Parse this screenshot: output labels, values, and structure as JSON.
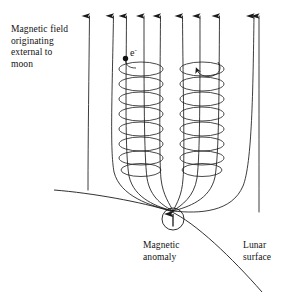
{
  "figure": {
    "background_color": "#ffffff",
    "line_color": "#1a1a1a",
    "text_color": "#111111"
  },
  "labels": {
    "external_field": "Magnetic field\noriginating\nexternal to\nmoon",
    "magnetic_anomaly": "Magnetic\nanomaly",
    "lunar_surface": "Lunar\nsurface",
    "electron": "e",
    "electron_charge": "-"
  },
  "diagram_data": {
    "type": "field-line-schematic",
    "field_lines": {
      "count": 8,
      "direction": "upward",
      "arrowheads_at": "top",
      "arrow_x_positions": [
        88,
        122,
        142,
        162,
        181,
        202,
        222,
        258
      ],
      "arrow_tip_y": 10,
      "description": "Vertical external magnetic field lines with upward arrowheads; inner lines bend into a cusp converging at the magnetic anomaly"
    },
    "helices": [
      {
        "name": "left-electron-gyration",
        "center_x": 141,
        "top_y": 62,
        "bottom_y": 176,
        "radius_x": 22,
        "radius_y": 7,
        "turns": 8,
        "particle": "electron"
      },
      {
        "name": "right-electron-gyration",
        "center_x": 202,
        "top_y": 62,
        "bottom_y": 176,
        "radius_x": 22,
        "radius_y": 7,
        "turns": 8,
        "particle": "electron"
      }
    ],
    "electron_marker": {
      "x": 125,
      "y": 58,
      "radius": 2.6
    },
    "rotation_arrow": {
      "near_x": 202,
      "near_y": 57,
      "sense": "counterclockwise-from-above"
    },
    "magnetic_anomaly": {
      "x": 173,
      "y": 219,
      "circle_radius": 11,
      "arrow_direction": "up"
    },
    "lunar_surface": {
      "left_end": [
        54,
        190
      ],
      "cusp_point": [
        173,
        211
      ],
      "right_end": [
        262,
        292
      ]
    }
  }
}
